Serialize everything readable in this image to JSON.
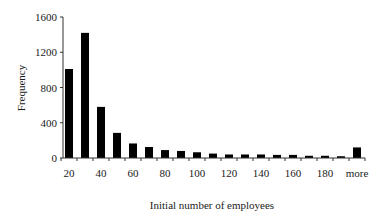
{
  "chart_data": {
    "type": "bar",
    "title": "",
    "xlabel": "Initial number of employees",
    "ylabel": "Frequency",
    "ylim": [
      0,
      1600
    ],
    "yticks": [
      0,
      400,
      800,
      1200,
      1600
    ],
    "grid": false,
    "legend": null,
    "categories": [
      "20",
      "30",
      "40",
      "50",
      "60",
      "70",
      "80",
      "90",
      "100",
      "110",
      "120",
      "130",
      "140",
      "150",
      "160",
      "170",
      "180",
      "190",
      "more"
    ],
    "xtick_labels": [
      "20",
      "40",
      "60",
      "80",
      "100",
      "120",
      "140",
      "160",
      "180",
      "more"
    ],
    "values": [
      1010,
      1420,
      580,
      285,
      165,
      125,
      90,
      80,
      65,
      50,
      40,
      40,
      40,
      35,
      35,
      25,
      25,
      20,
      120
    ],
    "bar_color": "#000000"
  }
}
